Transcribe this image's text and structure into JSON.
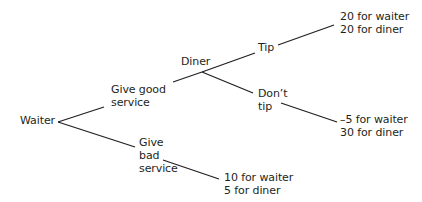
{
  "diagram": {
    "type": "game-tree",
    "nodes": {
      "root": {
        "label": "Waiter"
      },
      "diner": {
        "label": "Diner"
      }
    },
    "branches": {
      "good_service": {
        "line1": "Give good",
        "line2": "service"
      },
      "bad_service": {
        "line1": "Give",
        "line2": "bad",
        "line3": "service"
      },
      "tip": {
        "label": "Tip"
      },
      "dont_tip": {
        "line1": "Don’t",
        "line2": "tip"
      }
    },
    "payoffs": {
      "tip": {
        "waiter": "20 for waiter",
        "diner": "20 for diner"
      },
      "dont_tip": {
        "waiter": "–5 for waiter",
        "diner": "30 for diner"
      },
      "bad_service": {
        "waiter": "10 for waiter",
        "diner": "5 for diner"
      }
    }
  }
}
